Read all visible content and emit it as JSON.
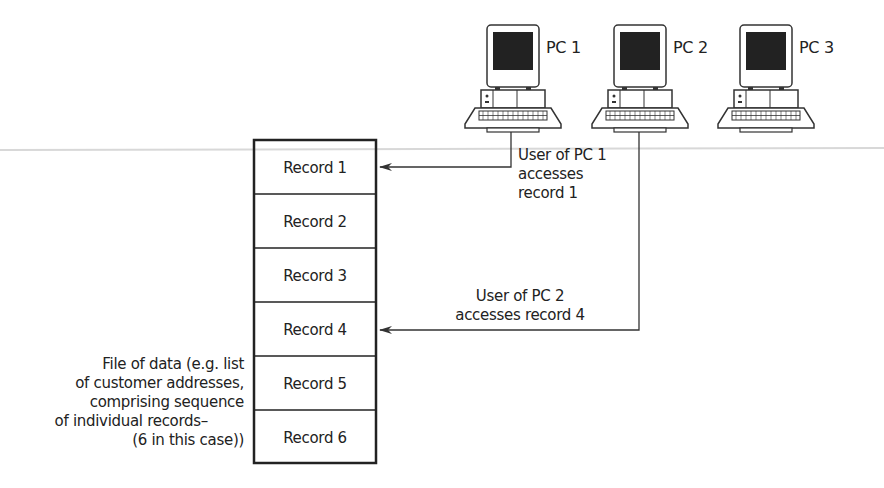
{
  "computers": [
    {
      "label": "PC 1",
      "icon": "desktop-computer-icon"
    },
    {
      "label": "PC 2",
      "icon": "desktop-computer-icon"
    },
    {
      "label": "PC 3",
      "icon": "desktop-computer-icon"
    }
  ],
  "file": {
    "records": [
      "Record 1",
      "Record 2",
      "Record 3",
      "Record 4",
      "Record 5",
      "Record 6"
    ],
    "caption": [
      "File of data (e.g. list",
      "of customer addresses,",
      "comprising sequence",
      "of individual records–",
      "(6 in this case))"
    ]
  },
  "annotations": {
    "pc1_access": [
      "User of PC 1",
      "accesses",
      "record 1"
    ],
    "pc2_access": [
      "User of PC 2",
      "accesses record 4"
    ]
  },
  "colors": {
    "line": "#333333",
    "screen": "#222222"
  }
}
